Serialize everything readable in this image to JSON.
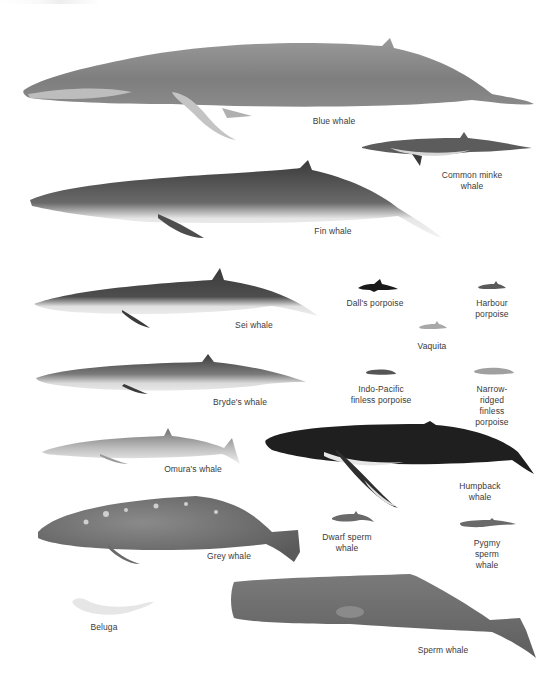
{
  "plate": {
    "subject": "Whale and porpoise species comparison",
    "background": "#ffffff",
    "label_color": "#3a3a3a"
  },
  "species": [
    {
      "id": "blue-whale",
      "label": "Blue whale",
      "label_x": 334,
      "label_y": 116,
      "tone": "#8d8d8d"
    },
    {
      "id": "common-minke-whale",
      "label": "Common minke\nwhale",
      "label_x": 472,
      "label_y": 170,
      "tone": "#5c5c5c"
    },
    {
      "id": "fin-whale",
      "label": "Fin whale",
      "label_x": 333,
      "label_y": 226,
      "tone": "#4d4d4d"
    },
    {
      "id": "sei-whale",
      "label": "Sei whale",
      "label_x": 254,
      "label_y": 320,
      "tone": "#4a4a4a"
    },
    {
      "id": "dalls-porpoise",
      "label": "Dall's porpoise",
      "label_x": 375,
      "label_y": 298,
      "tone": "#1a1a1a"
    },
    {
      "id": "harbour-porpoise",
      "label": "Harbour\nporpoise",
      "label_x": 492,
      "label_y": 298,
      "tone": "#5a5a5a"
    },
    {
      "id": "vaquita",
      "label": "Vaquita",
      "label_x": 432,
      "label_y": 341,
      "tone": "#9a9a9a"
    },
    {
      "id": "brydes-whale",
      "label": "Bryde's whale",
      "label_x": 240,
      "label_y": 397,
      "tone": "#555555"
    },
    {
      "id": "indo-pacific-finless-porpoise",
      "label": "Indo-Pacific\nfinless porpoise",
      "label_x": 381,
      "label_y": 384,
      "tone": "#555555"
    },
    {
      "id": "narrow-ridged-finless-porpoise",
      "label": "Narrow-ridged\nfinless porpoise",
      "label_x": 492,
      "label_y": 384,
      "tone": "#9a9a9a"
    },
    {
      "id": "omuras-whale",
      "label": "Omura's whale",
      "label_x": 193,
      "label_y": 464,
      "tone": "#8a8a8a"
    },
    {
      "id": "humpback-whale",
      "label": "Humpback whale",
      "label_x": 480,
      "label_y": 481,
      "tone": "#1f1f1f"
    },
    {
      "id": "grey-whale",
      "label": "Grey whale",
      "label_x": 229,
      "label_y": 551,
      "tone": "#6a6a6a"
    },
    {
      "id": "dwarf-sperm-whale",
      "label": "Dwarf sperm\nwhale",
      "label_x": 347,
      "label_y": 532,
      "tone": "#6a6a6a"
    },
    {
      "id": "pygmy-sperm-whale",
      "label": "Pygmy sperm\nwhale",
      "label_x": 487,
      "label_y": 538,
      "tone": "#6a6a6a"
    },
    {
      "id": "beluga",
      "label": "Beluga",
      "label_x": 104,
      "label_y": 622,
      "tone": "#e6e6e6"
    },
    {
      "id": "sperm-whale",
      "label": "Sperm whale",
      "label_x": 443,
      "label_y": 645,
      "tone": "#6e6e6e"
    }
  ]
}
